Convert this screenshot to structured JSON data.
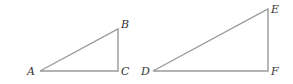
{
  "diagram": {
    "title": "",
    "stroke_color": "#9a9a9a",
    "label_color": "#333333",
    "triangles": [
      {
        "name": "triangle-abc",
        "vertices": [
          {
            "label": "A",
            "x": 40,
            "y": 71,
            "lx": 27,
            "ly": 75
          },
          {
            "label": "B",
            "x": 118,
            "y": 29,
            "lx": 121,
            "ly": 28
          },
          {
            "label": "C",
            "x": 118,
            "y": 71,
            "lx": 121,
            "ly": 75
          }
        ]
      },
      {
        "name": "triangle-def",
        "vertices": [
          {
            "label": "D",
            "x": 153,
            "y": 71,
            "lx": 141,
            "ly": 75
          },
          {
            "label": "E",
            "x": 268,
            "y": 9,
            "lx": 271,
            "ly": 13
          },
          {
            "label": "F",
            "x": 268,
            "y": 71,
            "lx": 271,
            "ly": 75
          }
        ]
      }
    ]
  }
}
